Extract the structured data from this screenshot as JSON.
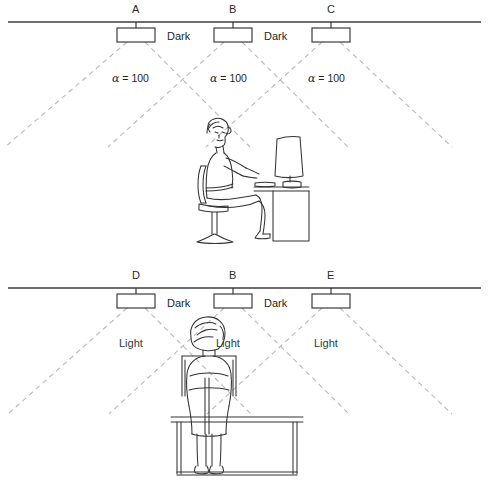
{
  "figure": {
    "type": "lighting-layout-diagram",
    "colors": {
      "ceiling_line": "#6e6e6e",
      "fixture_stroke": "#2b2b2b",
      "fixture_fill": "#ffffff",
      "beam_dash": "#b9b9b9",
      "figure_stroke": "#333333",
      "light_text": "#2a3c3c",
      "dark_text": "#1f1f1f"
    }
  },
  "panels": [
    {
      "id": "upper",
      "view": "side-view",
      "ceiling_y": 22,
      "luminaires": [
        {
          "label": "A",
          "x": 136
        },
        {
          "label": "B",
          "x": 233
        },
        {
          "label": "C",
          "x": 331
        }
      ],
      "between_labels": [
        {
          "text": "Dark",
          "x": 180,
          "y": 31
        },
        {
          "text": "Dark",
          "x": 277,
          "y": 31
        }
      ],
      "beam_labels": [
        {
          "text": "100",
          "symbol": "α",
          "eq": "=",
          "x": 112,
          "y": 73
        },
        {
          "text": "100",
          "symbol": "α",
          "eq": "=",
          "x": 210,
          "y": 73
        },
        {
          "text": "100",
          "symbol": "α",
          "eq": "=",
          "x": 308,
          "y": 73
        }
      ],
      "occupant": "seated-person-side-view-at-desk-with-monitor"
    },
    {
      "id": "lower",
      "view": "rear-view",
      "ceiling_y": 288,
      "luminaires": [
        {
          "label": "D",
          "x": 136
        },
        {
          "label": "B",
          "x": 233
        },
        {
          "label": "E",
          "x": 331
        }
      ],
      "between_labels": [
        {
          "text": "Dark",
          "x": 180,
          "y": 298
        },
        {
          "text": "Dark",
          "x": 277,
          "y": 298
        }
      ],
      "beam_labels": [
        {
          "text": "Light",
          "x": 119,
          "y": 338
        },
        {
          "text": "Light",
          "x": 216,
          "y": 338
        },
        {
          "text": "Light",
          "x": 314,
          "y": 338
        }
      ],
      "occupant": "seated-person-rear-view-at-desk"
    }
  ]
}
